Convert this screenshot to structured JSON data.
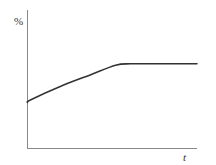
{
  "chart_data": {
    "type": "line",
    "title": "",
    "xlabel": "t",
    "ylabel": "%",
    "grid": false,
    "legend": null,
    "x_ticks": [],
    "y_ticks": [],
    "series": [
      {
        "name": "curve",
        "color": "#333333",
        "description": "starts at a positive intercept, rises with decreasing slope, then levels off to a horizontal plateau",
        "x": [
          0,
          0.02,
          0.2,
          0.37,
          0.52,
          0.61,
          0.75,
          1.0
        ],
        "values": [
          0.33,
          0.35,
          0.45,
          0.53,
          0.6,
          0.61,
          0.61,
          0.61
        ]
      }
    ],
    "xlim": [
      0,
      1
    ],
    "ylim": [
      0,
      1
    ]
  },
  "colors": {
    "axis": "#888888",
    "curve": "#333333",
    "background": "#ffffff"
  }
}
